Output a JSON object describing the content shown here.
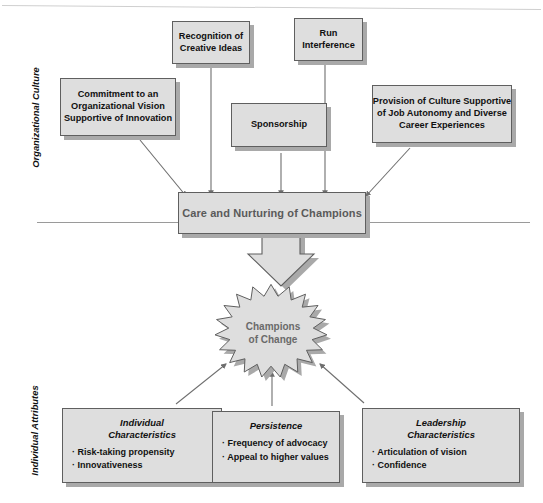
{
  "diagram": {
    "bands": [
      {
        "id": "organizational-culture",
        "label": "Organizational Culture"
      },
      {
        "id": "individual-attributes",
        "label": "Individual Attributes"
      }
    ],
    "culture_factors": [
      {
        "id": "commitment",
        "lines": [
          "Commitment to an",
          "Organizational Vision",
          "Supportive of Innovation"
        ]
      },
      {
        "id": "recognition",
        "lines": [
          "Recognition of",
          "Creative Ideas"
        ]
      },
      {
        "id": "run-interference",
        "lines": [
          "Run",
          "Interference"
        ]
      },
      {
        "id": "sponsorship",
        "lines": [
          "Sponsorship"
        ]
      },
      {
        "id": "provision-of-culture",
        "lines": [
          "Provision of Culture Supportive",
          "of Job Autonomy and Diverse",
          "Career Experiences"
        ]
      }
    ],
    "central": {
      "id": "care-and-nurturing",
      "label": "Care and Nurturing of Champions"
    },
    "burst": {
      "id": "champions-of-change",
      "line1": "Champions",
      "line2": "of Change"
    },
    "attributes": [
      {
        "id": "individual-characteristics",
        "heading_lines": [
          "Individual",
          "Characteristics"
        ],
        "bullets": [
          "Risk-taking propensity",
          "Innovativeness"
        ]
      },
      {
        "id": "persistence",
        "heading_lines": [
          "Persistence"
        ],
        "bullets": [
          "Frequency of advocacy",
          "Appeal to higher values"
        ]
      },
      {
        "id": "leadership-characteristics",
        "heading_lines": [
          "Leadership",
          "Characteristics"
        ],
        "bullets": [
          "Articulation of  vision",
          "Confidence"
        ]
      }
    ],
    "bullet_glyph": "·",
    "colors": {
      "box_fill": "#dedede",
      "box_border": "#5f5f5f",
      "box_shadow": "#a9a9a9",
      "connector": "#6e6e6e",
      "central_text": "#5a5a5a",
      "burst_text": "#6a6a6a",
      "page_background": "#ffffff"
    }
  }
}
